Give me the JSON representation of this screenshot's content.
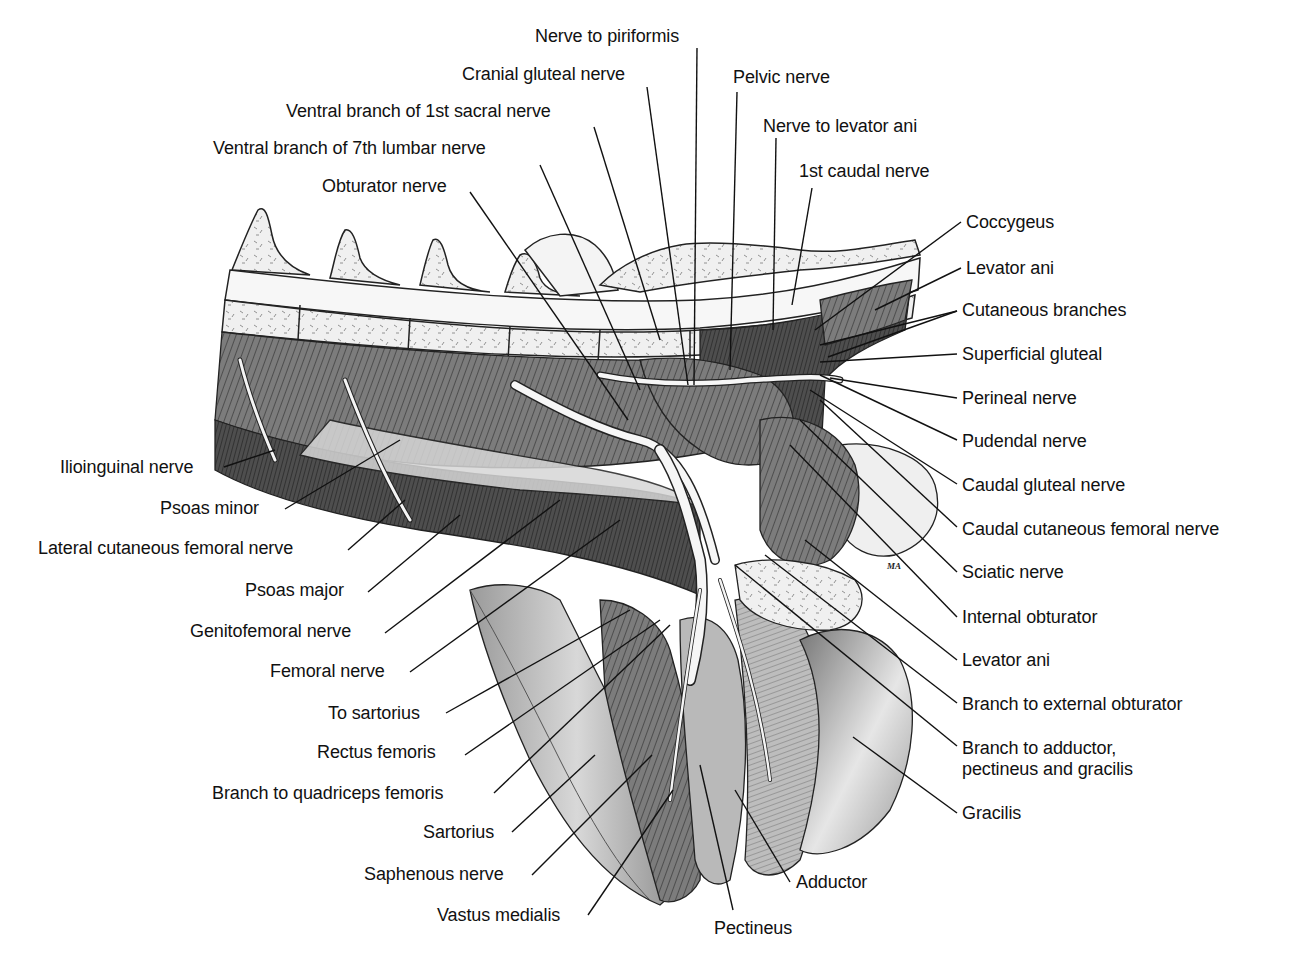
{
  "figure": {
    "signature": "MA",
    "colors": {
      "background": "#ffffff",
      "ink": "#111111",
      "muscle_dark": "#4a4a4a",
      "muscle_mid": "#8a8a8a",
      "muscle_light": "#c8c8c8",
      "bone": "#f2f2f2",
      "nerve": "#f4f4f4"
    }
  },
  "labels": [
    {
      "id": "nerve-to-piriformis",
      "text": "Nerve to piriformis",
      "x": 535,
      "y": 26,
      "align": "left",
      "line": [
        [
          697,
          48
        ],
        [
          694,
          385
        ]
      ]
    },
    {
      "id": "cranial-gluteal-nerve",
      "text": "Cranial gluteal nerve",
      "x": 462,
      "y": 64,
      "align": "left",
      "line": [
        [
          647,
          87
        ],
        [
          688,
          385
        ]
      ]
    },
    {
      "id": "pelvic-nerve",
      "text": "Pelvic nerve",
      "x": 733,
      "y": 67,
      "align": "left",
      "line": [
        [
          737,
          92
        ],
        [
          730,
          370
        ]
      ]
    },
    {
      "id": "ventral-branch-1st-sacral",
      "text": "Ventral branch of 1st sacral nerve",
      "x": 286,
      "y": 101,
      "align": "left",
      "line": [
        [
          594,
          127
        ],
        [
          660,
          340
        ]
      ]
    },
    {
      "id": "nerve-to-levator-ani",
      "text": "Nerve to levator ani",
      "x": 763,
      "y": 116,
      "align": "left",
      "line": [
        [
          776,
          138
        ],
        [
          773,
          330
        ]
      ]
    },
    {
      "id": "ventral-branch-7th-lumbar",
      "text": "Ventral branch of 7th lumbar nerve",
      "x": 213,
      "y": 138,
      "align": "left",
      "line": [
        [
          540,
          165
        ],
        [
          640,
          390
        ]
      ]
    },
    {
      "id": "1st-caudal-nerve",
      "text": "1st caudal nerve",
      "x": 799,
      "y": 161,
      "align": "left",
      "line": [
        [
          812,
          188
        ],
        [
          792,
          305
        ]
      ]
    },
    {
      "id": "obturator-nerve",
      "text": "Obturator nerve",
      "x": 322,
      "y": 176,
      "align": "left",
      "line": [
        [
          470,
          192
        ],
        [
          628,
          420
        ]
      ]
    },
    {
      "id": "coccygeus",
      "text": "Coccygeus",
      "x": 966,
      "y": 212,
      "align": "left",
      "line": [
        [
          961,
          222
        ],
        [
          815,
          330
        ]
      ]
    },
    {
      "id": "levator-ani-top",
      "text": "Levator ani",
      "x": 966,
      "y": 258,
      "align": "left",
      "line": [
        [
          961,
          268
        ],
        [
          875,
          310
        ]
      ]
    },
    {
      "id": "cutaneous-branches",
      "text": "Cutaneous branches",
      "x": 962,
      "y": 300,
      "align": "left",
      "line": [
        [
          957,
          311
        ],
        [
          820,
          345
        ]
      ],
      "line2": [
        [
          957,
          311
        ],
        [
          828,
          357
        ]
      ]
    },
    {
      "id": "superficial-gluteal",
      "text": "Superficial gluteal",
      "x": 962,
      "y": 344,
      "align": "left",
      "line": [
        [
          957,
          354
        ],
        [
          820,
          362
        ]
      ]
    },
    {
      "id": "perineal-nerve",
      "text": "Perineal nerve",
      "x": 962,
      "y": 388,
      "align": "left",
      "line": [
        [
          957,
          398
        ],
        [
          830,
          378
        ]
      ]
    },
    {
      "id": "pudendal-nerve",
      "text": "Pudendal nerve",
      "x": 962,
      "y": 431,
      "align": "left",
      "line": [
        [
          957,
          440
        ],
        [
          820,
          375
        ]
      ]
    },
    {
      "id": "caudal-gluteal-nerve",
      "text": "Caudal gluteal nerve",
      "x": 962,
      "y": 475,
      "align": "left",
      "line": [
        [
          957,
          484
        ],
        [
          810,
          390
        ]
      ]
    },
    {
      "id": "caudal-cutaneous-femoral-nerve",
      "text": "Caudal cutaneous femoral nerve",
      "x": 962,
      "y": 519,
      "align": "left",
      "line": [
        [
          957,
          527
        ],
        [
          820,
          400
        ]
      ]
    },
    {
      "id": "sciatic-nerve",
      "text": "Sciatic nerve",
      "x": 962,
      "y": 562,
      "align": "left",
      "line": [
        [
          957,
          572
        ],
        [
          800,
          420
        ]
      ]
    },
    {
      "id": "internal-obturator",
      "text": "Internal obturator",
      "x": 962,
      "y": 607,
      "align": "left",
      "line": [
        [
          957,
          617
        ],
        [
          790,
          445
        ]
      ]
    },
    {
      "id": "levator-ani-bottom",
      "text": "Levator ani",
      "x": 962,
      "y": 650,
      "align": "left",
      "line": [
        [
          957,
          660
        ],
        [
          805,
          540
        ]
      ]
    },
    {
      "id": "branch-to-external-obturator",
      "text": "Branch to external obturator",
      "x": 962,
      "y": 694,
      "align": "left",
      "line": [
        [
          957,
          703
        ],
        [
          765,
          555
        ]
      ]
    },
    {
      "id": "branch-to-adductor",
      "text": "Branch to adductor,",
      "text2": "pectineus and gracilis",
      "x": 962,
      "y": 738,
      "align": "left",
      "line": [
        [
          957,
          746
        ],
        [
          735,
          565
        ]
      ]
    },
    {
      "id": "gracilis",
      "text": "Gracilis",
      "x": 962,
      "y": 803,
      "align": "left",
      "line": [
        [
          957,
          813
        ],
        [
          853,
          737
        ]
      ]
    },
    {
      "id": "ilioinguinal-nerve",
      "text": "Ilioinguinal nerve",
      "x": 60,
      "y": 457,
      "align": "left",
      "line": [
        [
          224,
          467
        ],
        [
          275,
          450
        ]
      ]
    },
    {
      "id": "psoas-minor",
      "text": "Psoas minor",
      "x": 160,
      "y": 498,
      "align": "left",
      "line": [
        [
          285,
          509
        ],
        [
          400,
          440
        ]
      ]
    },
    {
      "id": "lateral-cutaneous-femoral-nerve",
      "text": "Lateral cutaneous femoral nerve",
      "x": 38,
      "y": 538,
      "align": "left",
      "line": [
        [
          348,
          550
        ],
        [
          405,
          500
        ]
      ]
    },
    {
      "id": "psoas-major",
      "text": "Psoas major",
      "x": 245,
      "y": 580,
      "align": "left",
      "line": [
        [
          368,
          592
        ],
        [
          460,
          515
        ]
      ]
    },
    {
      "id": "genitofemoral-nerve",
      "text": "Genitofemoral nerve",
      "x": 190,
      "y": 621,
      "align": "left",
      "line": [
        [
          385,
          633
        ],
        [
          560,
          500
        ]
      ]
    },
    {
      "id": "femoral-nerve",
      "text": "Femoral nerve",
      "x": 270,
      "y": 661,
      "align": "left",
      "line": [
        [
          410,
          672
        ],
        [
          620,
          520
        ]
      ]
    },
    {
      "id": "to-sartorius",
      "text": "To sartorius",
      "x": 328,
      "y": 703,
      "align": "left",
      "line": [
        [
          446,
          713
        ],
        [
          630,
          610
        ]
      ]
    },
    {
      "id": "rectus-femoris",
      "text": "Rectus femoris",
      "x": 317,
      "y": 742,
      "align": "left",
      "line": [
        [
          465,
          755
        ],
        [
          660,
          620
        ]
      ]
    },
    {
      "id": "branch-to-quadriceps-femoris",
      "text": "Branch to quadriceps femoris",
      "x": 212,
      "y": 783,
      "align": "left",
      "line": [
        [
          494,
          793
        ],
        [
          670,
          625
        ]
      ]
    },
    {
      "id": "sartorius",
      "text": "Sartorius",
      "x": 423,
      "y": 822,
      "align": "left",
      "line": [
        [
          512,
          832
        ],
        [
          595,
          755
        ]
      ]
    },
    {
      "id": "saphenous-nerve",
      "text": "Saphenous nerve",
      "x": 364,
      "y": 864,
      "align": "left",
      "line": [
        [
          532,
          875
        ],
        [
          652,
          755
        ]
      ]
    },
    {
      "id": "vastus-medialis",
      "text": "Vastus medialis",
      "x": 437,
      "y": 905,
      "align": "left",
      "line": [
        [
          588,
          915
        ],
        [
          673,
          790
        ]
      ]
    },
    {
      "id": "pectineus",
      "text": "Pectineus",
      "x": 714,
      "y": 918,
      "align": "left",
      "line": [
        [
          733,
          910
        ],
        [
          700,
          765
        ]
      ]
    },
    {
      "id": "adductor",
      "text": "Adductor",
      "x": 796,
      "y": 872,
      "align": "left",
      "line": [
        [
          790,
          882
        ],
        [
          735,
          790
        ]
      ]
    }
  ]
}
